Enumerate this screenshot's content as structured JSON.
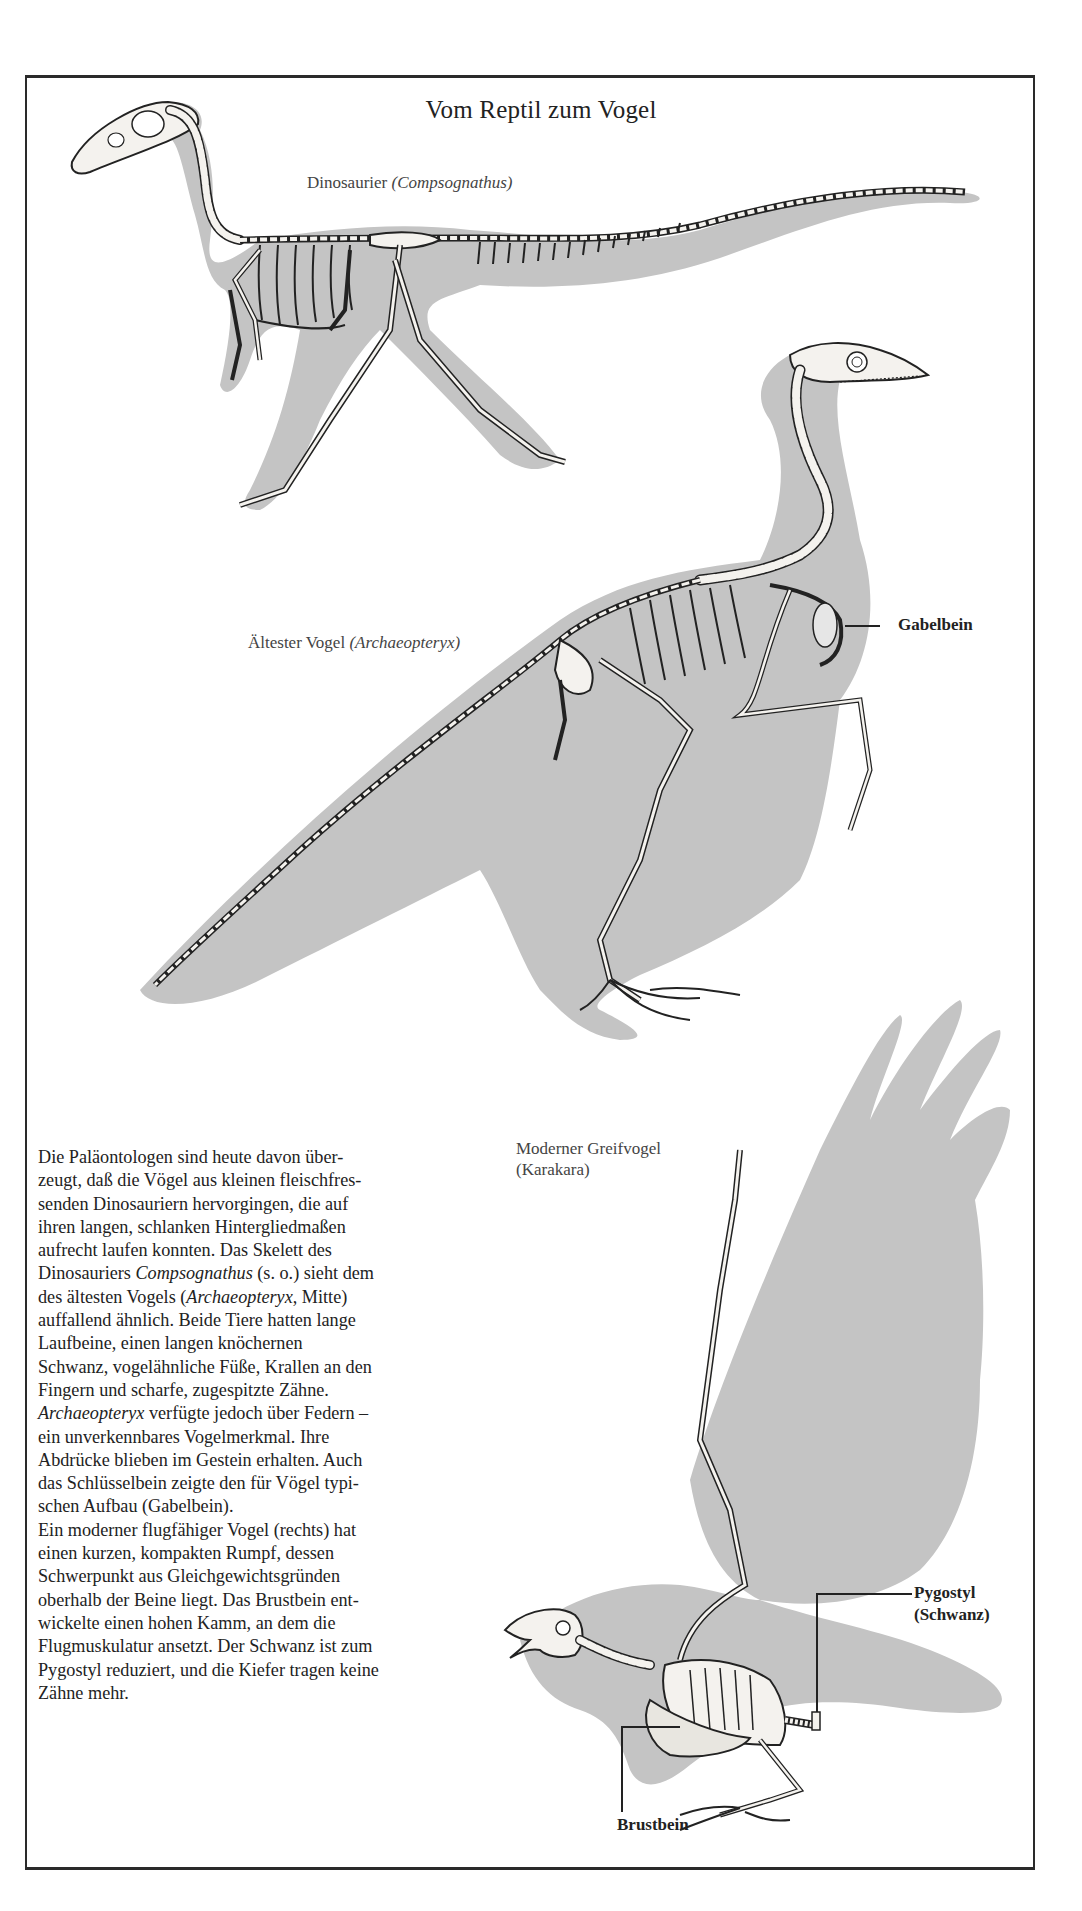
{
  "page": {
    "title": "Vom Reptil zum Vogel"
  },
  "figures": {
    "dinosaur": {
      "label_prefix": "Dinosaurier ",
      "label_species": "(Compsognathus)"
    },
    "archaeopteryx": {
      "label_prefix": "Ältester Vogel ",
      "label_species": "(Archaeopteryx)",
      "callouts": [
        {
          "id": "gabelbein",
          "text": "Gabelbein"
        }
      ]
    },
    "modern_bird": {
      "label_line1": "Moderner Greifvogel",
      "label_line2": "(Karakara)",
      "callouts": [
        {
          "id": "pygostyl",
          "line1": "Pygostyl",
          "line2": "(Schwanz)"
        },
        {
          "id": "brustbein",
          "text": "Brustbein"
        }
      ]
    }
  },
  "body_text": {
    "lines": [
      "Die Paläontologen sind heute davon über-",
      "zeugt, daß die Vögel aus kleinen fleischfres-",
      "senden Dinosauriern hervorgingen, die auf",
      "ihren langen, schlanken Hintergliedmaßen",
      "aufrecht laufen konnten. Das Skelett des",
      "Dinosauriers Compsognathus (s. o.) sieht dem",
      "des ältesten Vogels (Archaeopteryx, Mitte)",
      "auffallend ähnlich. Beide Tiere hatten lange",
      "Laufbeine, einen langen knöchernen",
      "Schwanz, vogelähnliche Füße, Krallen an den",
      "Fingern und scharfe, zugespitzte Zähne.",
      "Archaeopteryx verfügte jedoch über Federn –",
      "ein unverkennbares Vogelmerkmal. Ihre",
      "Abdrücke blieben im Gestein erhalten. Auch",
      "das Schlüsselbein zeigte den für Vögel typi-",
      "schen Aufbau (Gabelbein).",
      "Ein moderner flugfähiger Vogel (rechts) hat",
      "einen kurzen, kompakten Rumpf, dessen",
      "Schwerpunkt aus Gleichgewichtsgründen",
      "oberhalb der Beine liegt. Das Brustbein ent-",
      "wickelte einen hohen Kamm, an dem die",
      "Flugmuskulatur ansetzt. Der Schwanz ist zum",
      "Pygostyl reduziert, und die Kiefer tragen keine",
      "Zähne mehr."
    ]
  },
  "colors": {
    "silhouette": "#c4c4c4",
    "bone": "#f4f2ee",
    "ink": "#222222",
    "background": "#ffffff"
  }
}
